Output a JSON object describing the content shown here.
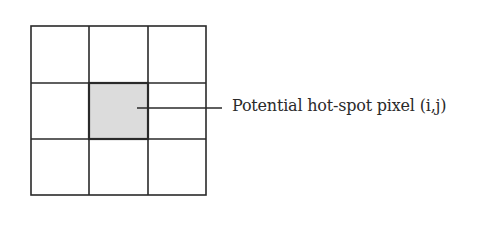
{
  "diagram": {
    "grid": {
      "rows": 3,
      "cols": 3,
      "highlighted_cell": {
        "row": 1,
        "col": 1
      }
    },
    "colors": {
      "line": "#2a2a2a",
      "highlight_fill": "#dcdcdc",
      "background": "#ffffff"
    },
    "annotation": {
      "label": "Potential hot-spot pixel (i,j)"
    }
  }
}
